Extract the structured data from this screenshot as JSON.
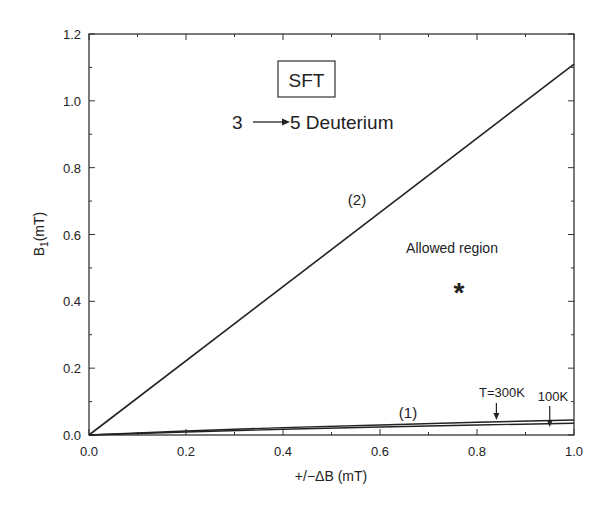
{
  "chart_data": {
    "type": "line",
    "title": "",
    "xlabel": "+/−ΔB (mT)",
    "ylabel_main": "B",
    "ylabel_sub": "1",
    "ylabel_unit": "(mT)",
    "xlim": [
      0.0,
      1.0
    ],
    "ylim": [
      0.0,
      1.2
    ],
    "xticks": [
      "0.0",
      "0.2",
      "0.4",
      "0.6",
      "0.8",
      "1.0"
    ],
    "yticks": [
      "0.0",
      "0.2",
      "0.4",
      "0.6",
      "0.8",
      "1.0",
      "1.2"
    ],
    "grid": false,
    "legend": "none",
    "series": [
      {
        "name": "(2)",
        "x": [
          0.0,
          1.0
        ],
        "y": [
          0.0,
          1.11
        ]
      },
      {
        "name": "(1) T=300K",
        "x": [
          0.0,
          0.2,
          0.4,
          0.6,
          0.8,
          1.0
        ],
        "y": [
          0.0,
          0.012,
          0.022,
          0.03,
          0.038,
          0.045
        ]
      },
      {
        "name": "(1) 100K",
        "x": [
          0.0,
          0.2,
          0.4,
          0.6,
          0.8,
          1.0
        ],
        "y": [
          0.0,
          0.009,
          0.017,
          0.024,
          0.03,
          0.035
        ]
      }
    ],
    "annotations": {
      "box_label": "SFT",
      "transition_from": "3",
      "transition_to": "5 Deuterium",
      "line2_label": "(2)",
      "line1_label": "(1)",
      "region_label": "Allowed region",
      "marker": "*",
      "marker_xy": [
        0.76,
        0.45
      ],
      "temp_300_label": "T=300K",
      "temp_300_x": 0.84,
      "temp_100_label": "100K",
      "temp_100_x": 0.95
    }
  }
}
